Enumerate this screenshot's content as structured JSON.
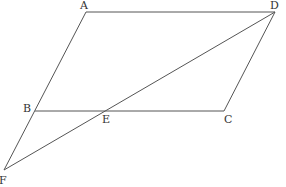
{
  "diagram": {
    "type": "geometry",
    "points": {
      "A": {
        "label": "A",
        "x": 86,
        "y": 12,
        "label_x": 80,
        "label_y": 9
      },
      "D": {
        "label": "D",
        "x": 275,
        "y": 12,
        "label_x": 270,
        "label_y": 9
      },
      "B": {
        "label": "B",
        "x": 35,
        "y": 111,
        "label_x": 23,
        "label_y": 112
      },
      "E": {
        "label": "E",
        "x": 105,
        "y": 111,
        "label_x": 102,
        "label_y": 123
      },
      "C": {
        "label": "C",
        "x": 224,
        "y": 111,
        "label_x": 224,
        "label_y": 123
      },
      "F": {
        "label": "F",
        "x": 4,
        "y": 170,
        "label_x": -1,
        "label_y": 184
      }
    },
    "segments": [
      {
        "from": "A",
        "to": "D"
      },
      {
        "from": "A",
        "to": "F"
      },
      {
        "from": "D",
        "to": "C"
      },
      {
        "from": "B",
        "to": "C"
      },
      {
        "from": "D",
        "to": "F"
      }
    ],
    "colors": {
      "line": "#555555",
      "label": "#333333",
      "background": "#ffffff"
    }
  }
}
